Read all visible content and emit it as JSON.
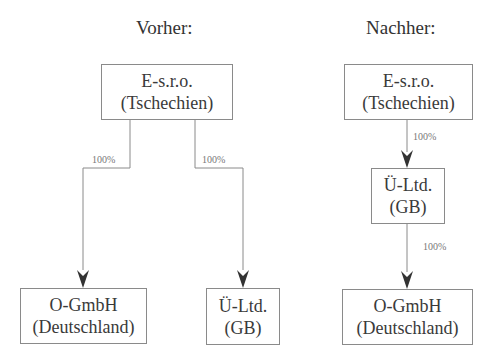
{
  "diagram": {
    "before": {
      "title": "Vorher:",
      "top": {
        "line1": "E-s.r.o.",
        "line2": "(Tschechien)"
      },
      "left": {
        "line1": "O-GmbH",
        "line2": "(Deutschland)"
      },
      "right": {
        "line1": "Ü-Ltd.",
        "line2": "(GB)"
      },
      "edge_left_label": "100%",
      "edge_right_label": "100%"
    },
    "after": {
      "title": "Nachher:",
      "top": {
        "line1": "E-s.r.o.",
        "line2": "(Tschechien)"
      },
      "middle": {
        "line1": "Ü-Ltd.",
        "line2": "(GB)"
      },
      "bottom": {
        "line1": "O-GmbH",
        "line2": "(Deutschland)"
      },
      "edge_top_label": "100%",
      "edge_bottom_label": "100%"
    },
    "colors": {
      "line": "#8a8a8a",
      "arrowhead": "#333333"
    }
  }
}
